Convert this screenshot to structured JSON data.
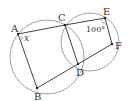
{
  "diagram": {
    "type": "geometry",
    "colors": {
      "stroke": "#444444",
      "circle": "#888888",
      "text": "#333333",
      "background": "#ffffff"
    },
    "points": {
      "A": {
        "label": "A",
        "x": 18,
        "y": 34,
        "lx": 11,
        "ly": 32
      },
      "B": {
        "label": "B",
        "x": 37,
        "y": 88,
        "lx": 34,
        "ly": 100
      },
      "C": {
        "label": "C",
        "x": 65,
        "y": 25,
        "lx": 58,
        "ly": 21
      },
      "D": {
        "label": "D",
        "x": 78,
        "y": 64,
        "lx": 76,
        "ly": 76
      },
      "E": {
        "label": "E",
        "x": 105,
        "y": 18,
        "lx": 103,
        "ly": 15
      },
      "F": {
        "label": "F",
        "x": 112,
        "y": 44,
        "lx": 115,
        "ly": 49
      }
    },
    "circles": [
      {
        "name": "circle-abdc",
        "cx": 47,
        "cy": 57,
        "r": 37
      },
      {
        "name": "circle-cefd",
        "cx": 90,
        "cy": 42,
        "r": 29
      }
    ],
    "segments": [
      [
        "A",
        "C"
      ],
      [
        "C",
        "E"
      ],
      [
        "E",
        "F"
      ],
      [
        "F",
        "D"
      ],
      [
        "D",
        "B"
      ],
      [
        "B",
        "A"
      ],
      [
        "C",
        "D"
      ]
    ],
    "angle_labels": {
      "x": {
        "text": "x",
        "x": 24,
        "y": 41
      },
      "angle_e": {
        "text": "100°",
        "x": 86,
        "y": 32
      }
    }
  }
}
